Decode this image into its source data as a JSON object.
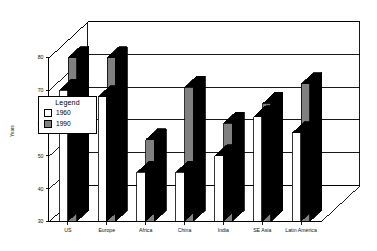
{
  "chart_data": {
    "type": "bar",
    "title": "",
    "subtitle": "",
    "xlabel": "",
    "ylabel": "Years",
    "ylim": [
      30,
      80
    ],
    "yticks": [
      30,
      40,
      50,
      60,
      70,
      80
    ],
    "ytick_labels": [
      "30",
      "40",
      "50",
      "60",
      "70",
      "80"
    ],
    "grid": true,
    "grid_axis": "y",
    "three_d": true,
    "legend": {
      "title": "Legend",
      "position": "upper-left-inside",
      "entries": [
        {
          "name": "1960",
          "color": "#ffffff",
          "edge": "#000000"
        },
        {
          "name": "1990",
          "color": "#808080",
          "edge": "#000000"
        }
      ]
    },
    "categories": [
      "US",
      "Europe",
      "Africa",
      "China",
      "India",
      "SE Asia",
      "Latin America"
    ],
    "series": [
      {
        "name": "1960",
        "color": "#ffffff",
        "values": [
          70,
          68,
          45,
          45,
          50,
          62,
          57
        ]
      },
      {
        "name": "1990",
        "color": "#808080",
        "values": [
          80,
          80,
          55,
          71,
          60,
          66,
          72
        ]
      }
    ]
  },
  "axis": {
    "y_title": "Years"
  }
}
